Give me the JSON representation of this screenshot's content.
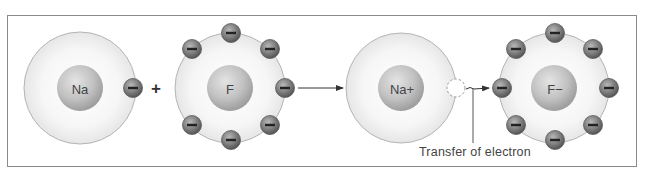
{
  "diagram": {
    "atoms": [
      {
        "id": "na",
        "nucleus_label": "Na",
        "cx": 80,
        "cy": 88,
        "shell_r": 56,
        "nucleus_r": 23,
        "electron_count": 1
      },
      {
        "id": "f",
        "nucleus_label": "F",
        "cx": 230,
        "cy": 88,
        "shell_r": 55,
        "nucleus_r": 23,
        "electron_count": 7
      },
      {
        "id": "na-ion",
        "nucleus_label": "Na+",
        "cx": 401,
        "cy": 88,
        "shell_r": 55,
        "nucleus_r": 23,
        "electron_count": 0
      },
      {
        "id": "f-ion",
        "nucleus_label": "F−",
        "cx": 554,
        "cy": 88,
        "shell_r": 55,
        "nucleus_r": 23,
        "electron_count": 8
      }
    ],
    "operator_plus": "+",
    "electron_symbol": "−",
    "caption": "Transfer of electron",
    "colors": {
      "shell_fill": "#f1f1f1",
      "shell_stroke": "#b5b5b5",
      "nucleus_fill": "#bdbdbd",
      "electron_fill": "#7a7a7a",
      "frame": "#8a8a8a",
      "arrow": "#333333"
    }
  }
}
